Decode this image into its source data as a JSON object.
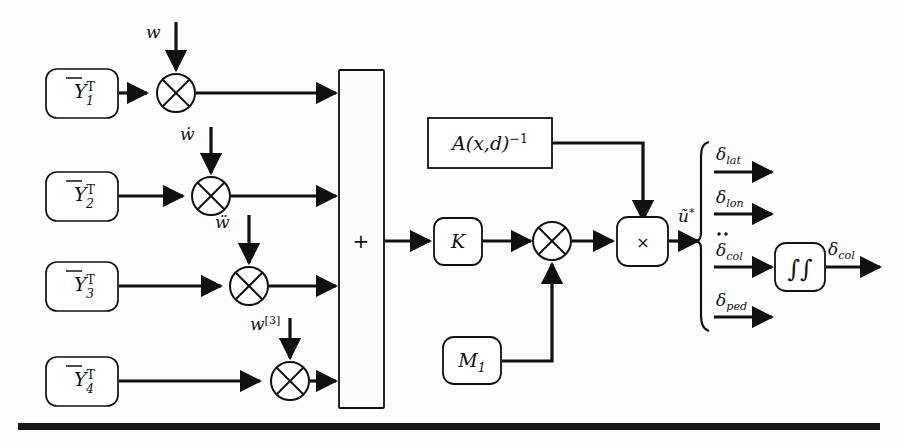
{
  "figure": {
    "kind": "control-system-block-diagram",
    "background_color": "#fdfdfd",
    "line_color": "#111111",
    "box_fill": "#ffffff",
    "bottom_rule": true
  },
  "input_blocks": [
    {
      "id": "y1",
      "base": "Y",
      "overbar": true,
      "sup": "T",
      "sub": "1",
      "text": "Ȳᵀ₁"
    },
    {
      "id": "y2",
      "base": "Y",
      "overbar": true,
      "sup": "T",
      "sub": "2",
      "text": "Ȳᵀ₂"
    },
    {
      "id": "y3",
      "base": "Y",
      "overbar": true,
      "sup": "T",
      "sub": "3",
      "text": "Ȳᵀ₃"
    },
    {
      "id": "y4",
      "base": "Y",
      "overbar": true,
      "sup": "T",
      "sub": "4",
      "text": "Ȳᵀ₄"
    }
  ],
  "disturbance_inputs": [
    {
      "id": "w0",
      "label": "w",
      "dots": 0
    },
    {
      "id": "w1",
      "label": "ẇ",
      "dots": 1
    },
    {
      "id": "w2",
      "label": "ẅ",
      "dots": 2
    },
    {
      "id": "w3",
      "label": "w[3]",
      "base": "w",
      "sup": "[3]",
      "dots": 0
    }
  ],
  "multipliers": [
    {
      "id": "mult-1",
      "glyph": "circle-x"
    },
    {
      "id": "mult-2",
      "glyph": "circle-x"
    },
    {
      "id": "mult-3",
      "glyph": "circle-x"
    },
    {
      "id": "mult-4",
      "glyph": "circle-x"
    },
    {
      "id": "mult-k",
      "glyph": "circle-x"
    }
  ],
  "summation_block": {
    "label": "+"
  },
  "gain_block": {
    "label": "K"
  },
  "inverse_block": {
    "base": "A(x,d)",
    "sup": "-1",
    "text": "A(x,d)⁻¹"
  },
  "mass_block": {
    "base": "M",
    "sub": "1",
    "text": "M₁"
  },
  "product_block": {
    "label": "×"
  },
  "integrator_block": {
    "label": "∬",
    "text": "∫∫"
  },
  "virtual_control": {
    "base": "ũ",
    "sup": "*",
    "text": "ũ*"
  },
  "outputs": [
    {
      "id": "delta-lat",
      "base": "δ",
      "sub": "lat",
      "dots": 0,
      "text": "δlat"
    },
    {
      "id": "delta-lon",
      "base": "δ",
      "sub": "lon",
      "dots": 0,
      "text": "δlon"
    },
    {
      "id": "delta-col-ddot",
      "base": "δ",
      "sub": "col",
      "dots": 2,
      "text": "δ̈col"
    },
    {
      "id": "delta-ped",
      "base": "δ",
      "sub": "ped",
      "dots": 0,
      "text": "δped"
    }
  ],
  "final_output": {
    "id": "delta-col",
    "base": "δ",
    "sub": "col",
    "dots": 0,
    "text": "δcol"
  }
}
